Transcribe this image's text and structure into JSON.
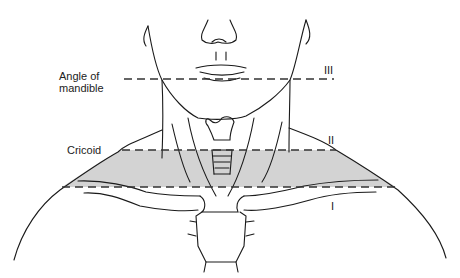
{
  "figure": {
    "type": "anatomical-diagram"
  },
  "labels": {
    "angle_of_mandible_line1": "Angle of",
    "angle_of_mandible_line2": "mandible",
    "cricoid": "Cricoid"
  },
  "zones": {
    "zone_3": "III",
    "zone_2": "II",
    "zone_1": "I"
  },
  "colors": {
    "shading": "#d3d3d3",
    "line": "#1a1a1a",
    "dashes": "#333333"
  }
}
